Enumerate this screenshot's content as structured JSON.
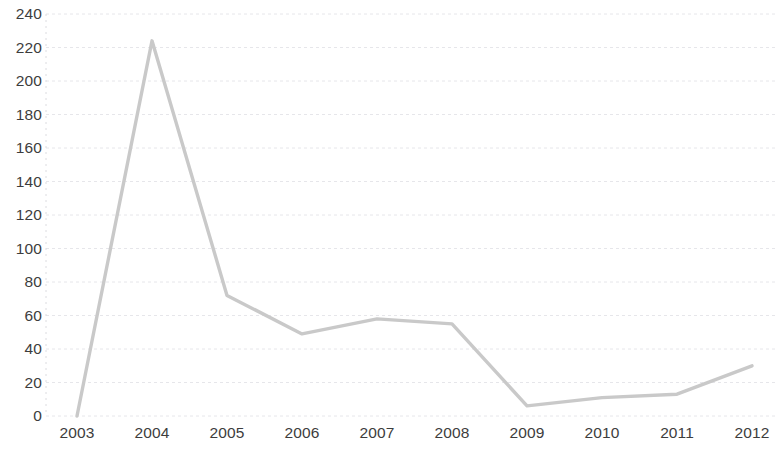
{
  "chart_data": {
    "type": "line",
    "title": "",
    "subtitle": "",
    "xlabel": "",
    "ylabel": "",
    "categories": [
      "2003",
      "2004",
      "2005",
      "2006",
      "2007",
      "2008",
      "2009",
      "2010",
      "2011",
      "2012"
    ],
    "x": [
      2003,
      2004,
      2005,
      2006,
      2007,
      2008,
      2009,
      2010,
      2011,
      2012
    ],
    "values": [
      0,
      224,
      72,
      49,
      58,
      55,
      6,
      11,
      13,
      30
    ],
    "series": [
      {
        "name": "",
        "values": [
          0,
          224,
          72,
          49,
          58,
          55,
          6,
          11,
          13,
          30
        ]
      }
    ],
    "ylim": [
      0,
      240
    ],
    "ytick_labels": [
      "0",
      "20",
      "40",
      "60",
      "80",
      "100",
      "120",
      "140",
      "160",
      "180",
      "200",
      "220",
      "240"
    ],
    "ytick_values": [
      0,
      20,
      40,
      60,
      80,
      100,
      120,
      140,
      160,
      180,
      200,
      220,
      240
    ],
    "xtick_labels": [
      "2003",
      "2004",
      "2005",
      "2006",
      "2007",
      "2008",
      "2009",
      "2010",
      "2011",
      "2012"
    ],
    "grid": "horizontal-dashed",
    "legend": "none",
    "line_color": "#c9c9c9",
    "grid_color": "#e6e6ea",
    "axis_text_color": "#3d3d3d",
    "annotations": []
  },
  "layout": {
    "plot_left": 46,
    "plot_right": 775,
    "plot_top": 14,
    "plot_bottom": 416,
    "first_point_x": 77,
    "point_spacing": 75
  }
}
